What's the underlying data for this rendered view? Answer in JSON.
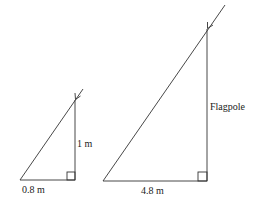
{
  "diagram": {
    "type": "similar-triangles-shadow",
    "small_triangle": {
      "height_label": "1 m",
      "base_label": "0.8 m"
    },
    "large_triangle": {
      "height_label": "Flagpole",
      "base_label": "4.8 m"
    },
    "stroke_color": "#333333"
  }
}
